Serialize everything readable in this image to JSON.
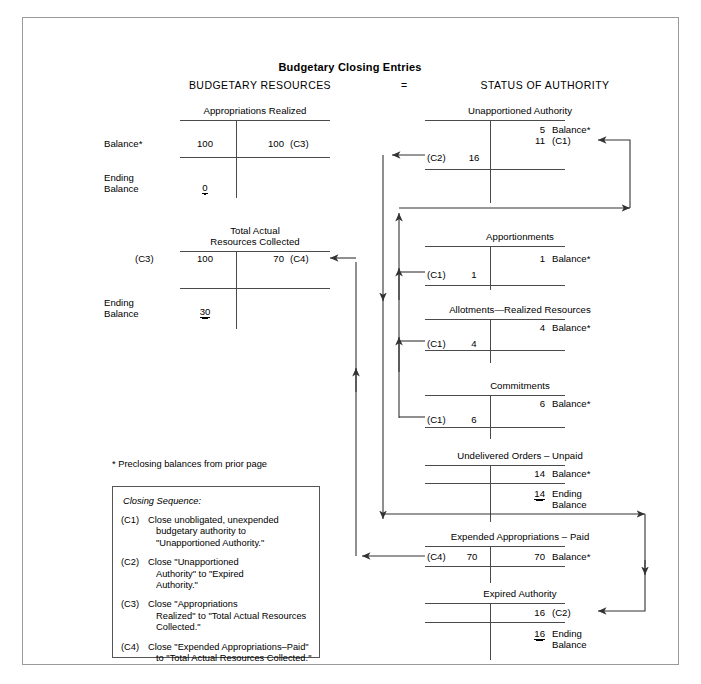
{
  "header": {
    "label": "ILLUSTRATION 19-5",
    "title_main": "The Use of Budget Authority and Closings of Budget Accounts (",
    "title_italic": "Continued",
    "title_end": ")"
  },
  "diagram": {
    "title": "Budgetary Closing Entries",
    "left_column_head": "BUDGETARY RESOURCES",
    "equals": "=",
    "right_column_head": "STATUS OF AUTHORITY"
  },
  "accounts": {
    "appropriations_realized": {
      "name": "Appropriations Realized",
      "left_label": "Balance*",
      "left_amount": "100",
      "right_amount": "100",
      "right_ref": "(C3)",
      "ending_label_1": "Ending",
      "ending_label_2": "Balance",
      "ending_amount": "0"
    },
    "total_actual_resources": {
      "name_line1": "Total Actual",
      "name_line2": "Resources Collected",
      "left_ref": "(C3)",
      "left_amount": "100",
      "right_amount": "70",
      "right_ref": "(C4)",
      "ending_label_1": "Ending",
      "ending_label_2": "Balance",
      "ending_amount": "30"
    },
    "unapportioned_authority": {
      "name": "Unapportioned Authority",
      "balance_amount": "5",
      "balance_label": "Balance*",
      "c1_amount": "11",
      "c1_ref": "(C1)",
      "left_ref": "(C2)",
      "left_amount": "16"
    },
    "apportionments": {
      "name": "Apportionments",
      "balance_amount": "1",
      "balance_label": "Balance*",
      "left_ref": "(C1)",
      "left_amount": "1"
    },
    "allotments_realized_resources": {
      "name": "Allotments—Realized Resources",
      "balance_amount": "4",
      "balance_label": "Balance*",
      "left_ref": "(C1)",
      "left_amount": "4"
    },
    "commitments": {
      "name": "Commitments",
      "balance_amount": "6",
      "balance_label": "Balance*",
      "left_ref": "(C1)",
      "left_amount": "6"
    },
    "undelivered_orders_unpaid": {
      "name": "Undelivered Orders – Unpaid",
      "balance_amount": "14",
      "balance_label": "Balance*",
      "ending_amount": "14",
      "ending_label_1": "Ending",
      "ending_label_2": "Balance"
    },
    "expended_appropriations_paid": {
      "name": "Expended Appropriations – Paid",
      "left_ref": "(C4)",
      "left_amount": "70",
      "right_amount": "70",
      "right_label": "Balance*"
    },
    "expired_authority": {
      "name": "Expired Authority",
      "right_amount": "16",
      "right_ref": "(C2)",
      "ending_amount": "16",
      "ending_label_1": "Ending",
      "ending_label_2": "Balance"
    }
  },
  "footnote": "* Preclosing balances from prior page",
  "legend": {
    "heading": "Closing Sequence:",
    "items": [
      {
        "tag": "(C1)",
        "line1": "Close unobligated, unexpended",
        "line2": "budgetary authority to",
        "line3": "\"Unapportioned Authority.\""
      },
      {
        "tag": "(C2)",
        "line1": "Close \"Unapportioned",
        "line2": "Authority\" to \"Expired",
        "line3": "Authority.\""
      },
      {
        "tag": "(C3)",
        "line1": "Close \"Appropriations",
        "line2": "Realized\" to \"Total Actual Resources",
        "line3": "Collected.\""
      },
      {
        "tag": "(C4)",
        "line1": "Close \"Expended Appropriations–Paid\"",
        "line2": "to \"Total Actual Resources Collected.\"",
        "line3": ""
      }
    ]
  },
  "colors": {
    "header_bg": "#000000",
    "frame_border": "#9a9a9a",
    "rule": "#4a4a4a",
    "arrow": "#333333"
  }
}
